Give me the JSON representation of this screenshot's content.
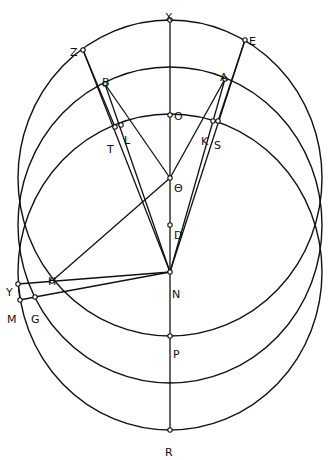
{
  "diagram": {
    "title": "",
    "stroke_color": "#111111",
    "background": "#ffffff",
    "ellipses": [
      {
        "name": "upper-circle",
        "cx": 170,
        "cy": 178,
        "rx": 152,
        "ry": 158
      },
      {
        "name": "middle-circle",
        "cx": 170,
        "cy": 225,
        "rx": 152,
        "ry": 158
      },
      {
        "name": "lower-circle",
        "cx": 170,
        "cy": 272,
        "rx": 152,
        "ry": 158
      }
    ],
    "points": [
      {
        "id": "X",
        "label": "X",
        "x": 170,
        "y": 20,
        "lx": 165,
        "ly": 13
      },
      {
        "id": "Z",
        "label": "Z",
        "x": 83,
        "y": 50,
        "lx": 70,
        "ly": 48
      },
      {
        "id": "E",
        "label": "E",
        "x": 245,
        "y": 40,
        "lx": 249,
        "ly": 37
      },
      {
        "id": "B",
        "label": "B",
        "x": 105,
        "y": 84,
        "lx": 102,
        "ly": 78
      },
      {
        "id": "A",
        "label": "A",
        "x": 225,
        "y": 79,
        "lx": 220,
        "ly": 73
      },
      {
        "id": "O",
        "label": "O",
        "x": 170,
        "y": 115,
        "lx": 174,
        "ly": 112
      },
      {
        "id": "T",
        "label": "T",
        "x": 115,
        "y": 127,
        "lx": 107,
        "ly": 145
      },
      {
        "id": "L",
        "label": "L",
        "x": 121,
        "y": 125,
        "lx": 124,
        "ly": 136
      },
      {
        "id": "K",
        "label": "K",
        "x": 213,
        "y": 121,
        "lx": 201,
        "ly": 137
      },
      {
        "id": "S",
        "label": "S",
        "x": 218,
        "y": 121,
        "lx": 214,
        "ly": 141
      },
      {
        "id": "Theta",
        "label": "Θ",
        "x": 170,
        "y": 178,
        "lx": 174,
        "ly": 184
      },
      {
        "id": "D",
        "label": "D",
        "x": 170,
        "y": 225,
        "lx": 174,
        "ly": 231
      },
      {
        "id": "N",
        "label": "N",
        "x": 170,
        "y": 272,
        "lx": 172,
        "ly": 290
      },
      {
        "id": "H",
        "label": "H",
        "x": 52,
        "y": 281,
        "lx": 48,
        "ly": 277
      },
      {
        "id": "Y",
        "label": "Y",
        "x": 18,
        "y": 284,
        "lx": 6,
        "ly": 288
      },
      {
        "id": "M",
        "label": "M",
        "x": 20,
        "y": 300,
        "lx": 7,
        "ly": 315
      },
      {
        "id": "G",
        "label": "G",
        "x": 35,
        "y": 297,
        "lx": 31,
        "ly": 315
      },
      {
        "id": "P",
        "label": "P",
        "x": 170,
        "y": 336,
        "lx": 173,
        "ly": 350
      },
      {
        "id": "R",
        "label": "R",
        "x": 170,
        "y": 430,
        "lx": 165,
        "ly": 448
      }
    ],
    "segments": [
      [
        "X",
        "R"
      ],
      [
        "Z",
        "N"
      ],
      [
        "Z",
        "T"
      ],
      [
        "B",
        "N"
      ],
      [
        "B",
        "Theta"
      ],
      [
        "E",
        "N"
      ],
      [
        "E",
        "S"
      ],
      [
        "A",
        "N"
      ],
      [
        "A",
        "Theta"
      ],
      [
        "H",
        "Theta"
      ],
      [
        "Y",
        "N"
      ],
      [
        "G",
        "N"
      ],
      [
        "Y",
        "M"
      ],
      [
        "M",
        "G"
      ]
    ]
  }
}
